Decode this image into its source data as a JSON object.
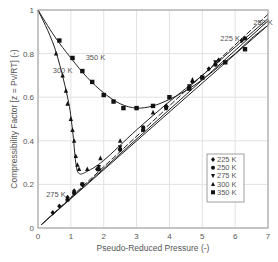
{
  "chart_data": {
    "type": "scatter",
    "title": "",
    "xlabel": "Pseudo-Reduced Pressure (-)",
    "ylabel": "Compressibility Factor [z = Pv/RT] (-)",
    "xlim": [
      0,
      7
    ],
    "ylim": [
      0,
      1
    ],
    "xticks": [
      "0",
      "1",
      "2",
      "3",
      "4",
      "5",
      "6",
      "7"
    ],
    "yticks": [
      "0",
      "0.2",
      "0.4",
      "0.6",
      "0.8",
      "1"
    ],
    "grid": true,
    "legend_position": "lower right (inside)",
    "legend": [
      {
        "label": "225 K",
        "marker": "diamond"
      },
      {
        "label": "250 K",
        "marker": "circle"
      },
      {
        "label": "275 K",
        "marker": "triangle-down"
      },
      {
        "label": "300 K",
        "marker": "triangle-up"
      },
      {
        "label": "350 K",
        "marker": "square"
      }
    ],
    "annotations": [
      {
        "text": "350 K",
        "x": 1.45,
        "y": 0.77
      },
      {
        "text": "300 K",
        "x": 0.45,
        "y": 0.71
      },
      {
        "text": "225 K",
        "x": 5.55,
        "y": 0.86
      },
      {
        "text": "250 K",
        "x": 6.55,
        "y": 0.93
      },
      {
        "text": "275 K",
        "x": 0.25,
        "y": 0.14
      }
    ],
    "series": [
      {
        "name": "225 K",
        "marker": "diamond",
        "points": [
          [
            0.45,
            0.07
          ],
          [
            0.65,
            0.1
          ],
          [
            0.9,
            0.14
          ],
          [
            1.1,
            0.17
          ],
          [
            1.35,
            0.2
          ],
          [
            1.8,
            0.27
          ],
          [
            2.5,
            0.36
          ],
          [
            3.2,
            0.46
          ],
          [
            3.9,
            0.56
          ],
          [
            4.7,
            0.67
          ],
          [
            5.2,
            0.73
          ],
          [
            5.5,
            0.77
          ],
          [
            6.2,
            0.86
          ]
        ],
        "curve": [
          [
            0.1,
            0.015
          ],
          [
            7.0,
            0.98
          ]
        ]
      },
      {
        "name": "250 K",
        "marker": "circle",
        "points": [
          [
            0.9,
            0.13
          ],
          [
            1.1,
            0.16
          ],
          [
            1.35,
            0.2
          ],
          [
            1.85,
            0.27
          ],
          [
            2.5,
            0.36
          ],
          [
            3.2,
            0.45
          ],
          [
            3.9,
            0.55
          ],
          [
            4.6,
            0.64
          ],
          [
            5.4,
            0.75
          ],
          [
            6.3,
            0.87
          ]
        ],
        "curve": [
          [
            0.1,
            0.015
          ],
          [
            7.0,
            0.95
          ]
        ]
      },
      {
        "name": "275 K",
        "marker": "triangle-down",
        "points": [
          [
            1.35,
            0.2
          ],
          [
            1.85,
            0.28
          ],
          [
            2.5,
            0.37
          ],
          [
            3.2,
            0.46
          ],
          [
            3.9,
            0.55
          ],
          [
            4.6,
            0.65
          ],
          [
            5.4,
            0.76
          ]
        ],
        "curve": [
          [
            0.1,
            0.015
          ],
          [
            7.0,
            0.93
          ]
        ]
      },
      {
        "name": "300 K",
        "marker": "triangle-up",
        "points": [
          [
            0.55,
            0.8
          ],
          [
            0.75,
            0.7
          ],
          [
            0.85,
            0.63
          ],
          [
            0.9,
            0.57
          ],
          [
            1.0,
            0.5
          ],
          [
            1.05,
            0.45
          ],
          [
            1.1,
            0.4
          ],
          [
            1.15,
            0.33
          ],
          [
            1.2,
            0.29
          ],
          [
            1.25,
            0.27
          ],
          [
            1.5,
            0.27
          ],
          [
            1.9,
            0.32
          ],
          [
            2.5,
            0.4
          ],
          [
            3.5,
            0.53
          ],
          [
            4.7,
            0.68
          ]
        ],
        "curve": [
          [
            0,
            1.0
          ],
          [
            0.5,
            0.83
          ],
          [
            0.9,
            0.6
          ],
          [
            1.05,
            0.45
          ],
          [
            1.15,
            0.3
          ],
          [
            1.25,
            0.25
          ],
          [
            1.5,
            0.26
          ],
          [
            2.0,
            0.31
          ],
          [
            3.0,
            0.45
          ],
          [
            4.0,
            0.58
          ],
          [
            5.0,
            0.7
          ],
          [
            6.0,
            0.83
          ],
          [
            7.0,
            0.96
          ]
        ]
      },
      {
        "name": "350 K",
        "marker": "square",
        "points": [
          [
            0.65,
            0.86
          ],
          [
            1.05,
            0.78
          ],
          [
            1.35,
            0.72
          ],
          [
            1.65,
            0.67
          ],
          [
            2.0,
            0.61
          ],
          [
            2.3,
            0.58
          ],
          [
            2.6,
            0.55
          ],
          [
            3.0,
            0.55
          ],
          [
            3.5,
            0.56
          ],
          [
            4.0,
            0.6
          ],
          [
            4.6,
            0.64
          ],
          [
            5.0,
            0.69
          ],
          [
            5.7,
            0.76
          ],
          [
            6.3,
            0.82
          ]
        ],
        "curve": [
          [
            0,
            1.0
          ],
          [
            0.5,
            0.88
          ],
          [
            1.0,
            0.78
          ],
          [
            1.5,
            0.69
          ],
          [
            2.0,
            0.62
          ],
          [
            2.5,
            0.57
          ],
          [
            3.0,
            0.55
          ],
          [
            3.5,
            0.56
          ],
          [
            4.0,
            0.59
          ],
          [
            4.5,
            0.63
          ],
          [
            5.0,
            0.68
          ],
          [
            5.5,
            0.74
          ],
          [
            6.0,
            0.8
          ],
          [
            6.5,
            0.87
          ],
          [
            7.0,
            0.93
          ]
        ]
      }
    ]
  }
}
